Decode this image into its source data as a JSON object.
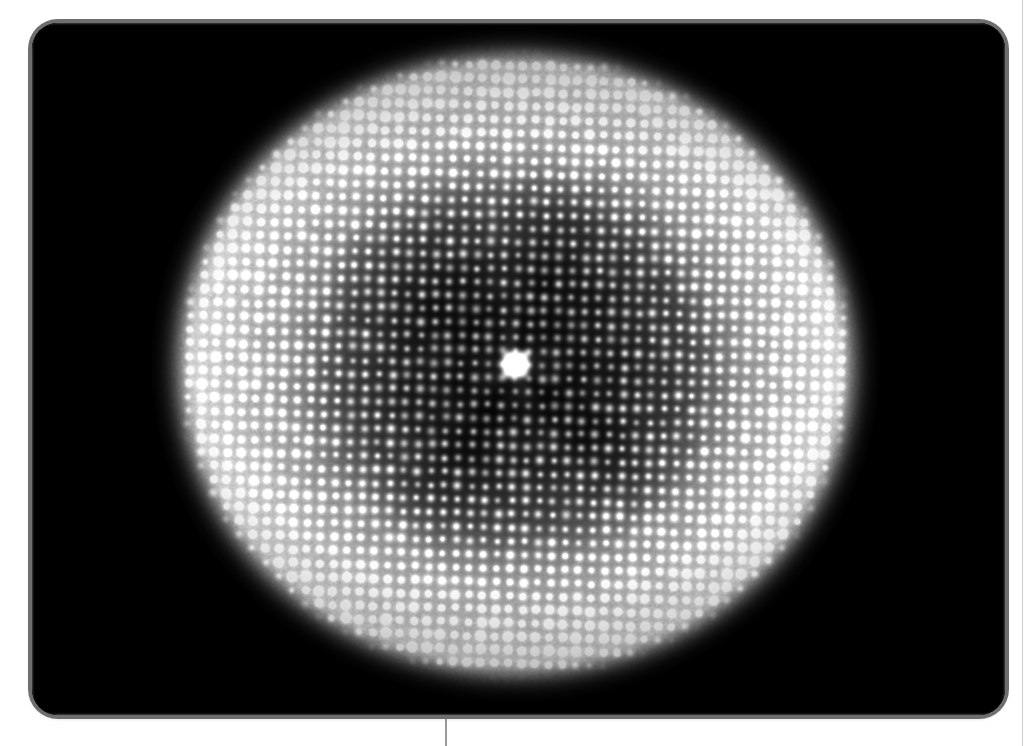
{
  "figure": {
    "kind": "micrograph",
    "caption_hidden": "",
    "background_color": "#ffffff",
    "panel": {
      "name": "image-panel",
      "x": 32,
      "y": 23,
      "width": 973,
      "height": 692,
      "corner_radius": 26,
      "fill_color": "#000000",
      "border_color": "#6e6e6e",
      "border_width": 4
    },
    "rules": [
      {
        "name": "bottom-center-rule",
        "orientation": "vertical",
        "x": 445,
        "y": 713,
        "length": 33,
        "color": "#9a9a9a"
      },
      {
        "name": "right-edge-rule",
        "orientation": "vertical",
        "x": 1022,
        "y": 0,
        "length": 746,
        "color": "#cdcdcd"
      }
    ]
  },
  "chart_data": {
    "type": "heatmap",
    "title": "",
    "subtitle": "",
    "xlabel": "",
    "ylabel": "",
    "colormap": "grayscale",
    "value_range": [
      0,
      255
    ],
    "grid": false,
    "legend": "none",
    "description": "Greyscale micrograph: circular illuminated disk on a black field, filled with a regular square lattice of bright point-like spots, a single very bright spot at the disk centre, and a brighter annular halo at the disk rim.",
    "field": {
      "width": 973,
      "height": 692,
      "background_level": 0
    },
    "disk": {
      "center_x": 483,
      "center_y": 341,
      "radius_x": 320,
      "radius_y": 296,
      "edge_softness": 26,
      "rim_brightness": 210,
      "core_brightness": 34,
      "rim_band_inner_fraction": 0.62,
      "rim_band_outer_fraction": 1.0
    },
    "lattice": {
      "type": "square",
      "spacing_px": 13.6,
      "rotation_deg": 1.5,
      "spot_radius_px": 2.4,
      "spot_peak_level": 255,
      "spot_falloff": "gaussian"
    },
    "central_spot": {
      "center_x": 483,
      "center_y": 341,
      "radius_px": 13,
      "peak_level": 255,
      "shape": "rounded-square"
    },
    "dark_rings": [
      {
        "radius_fraction": 0.18,
        "level_drop": 0.55
      },
      {
        "radius_fraction": 0.34,
        "level_drop": 0.4
      },
      {
        "radius_fraction": 0.5,
        "level_drop": 0.22
      }
    ],
    "noise": {
      "type": "speckle",
      "amplitude": 0.1
    }
  }
}
